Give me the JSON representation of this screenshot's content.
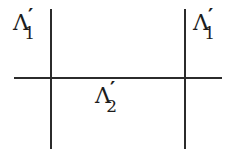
{
  "figure": {
    "kind": "math-diagram",
    "background_color": "#ffffff",
    "stroke_color": "#2b2b2b",
    "width": 235,
    "height": 149,
    "lines": [
      {
        "name": "left-vertical-line",
        "orientation": "vertical",
        "x": 50,
        "y1": 9,
        "y2": 149
      },
      {
        "name": "right-vertical-line",
        "orientation": "vertical",
        "x": 184,
        "y1": 9,
        "y2": 149
      },
      {
        "name": "horizontal-line",
        "orientation": "horizontal",
        "y": 77,
        "x1": 14,
        "x2": 222
      }
    ],
    "labels": [
      {
        "name": "label-lambda-1-left",
        "base": "Λ",
        "prime": "′",
        "subscript": "1",
        "position": "left-top"
      },
      {
        "name": "label-lambda-1-right",
        "base": "Λ",
        "prime": "′",
        "subscript": "1",
        "position": "right-top"
      },
      {
        "name": "label-lambda-2-bottom",
        "base": "Λ",
        "prime": "′",
        "subscript": "2",
        "position": "bottom-mid"
      }
    ]
  }
}
